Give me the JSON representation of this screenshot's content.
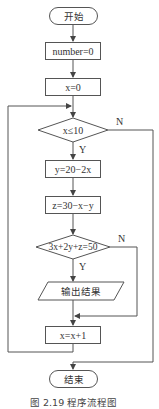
{
  "diagram": {
    "type": "flowchart",
    "nodes": {
      "start": "开始",
      "init_number": "number=0",
      "init_x": "x=0",
      "cond_x": "x≤10",
      "calc_y": "y=20−2x",
      "calc_z": "z=30−x−y",
      "cond_eq": "3x+2y+z=50",
      "output": "输出结果",
      "increment": "x=x+1",
      "end": "结束"
    },
    "edge_labels": {
      "cond_x_yes": "Y",
      "cond_x_no": "N",
      "cond_eq_yes": "Y",
      "cond_eq_no": "N"
    },
    "caption": "图 2.19   程序流程图"
  }
}
